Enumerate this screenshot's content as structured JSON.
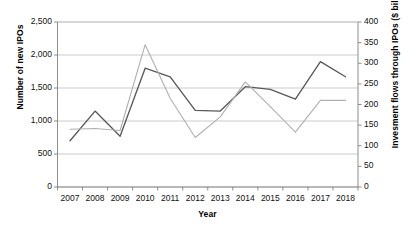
{
  "chart_data": {
    "type": "line",
    "title": "",
    "xlabel": "Year",
    "ylabel": "Number of new IPOs",
    "ylabel_secondary": "Invesment flows through IPOs ($ billion)",
    "categories": [
      "2007",
      "2008",
      "2009",
      "2010",
      "2011",
      "2012",
      "2013",
      "2014",
      "2015",
      "2016",
      "2017",
      "2018"
    ],
    "x": [
      2007,
      2008,
      2009,
      2010,
      2011,
      2012,
      2013,
      2014,
      2015,
      2016,
      2017,
      2018
    ],
    "ylim": [
      0,
      2500
    ],
    "yticks": [
      0,
      500,
      1000,
      1500,
      2000,
      2500
    ],
    "ytick_labels": [
      "0",
      "500",
      "1,000",
      "1,500",
      "2,000",
      "2,500"
    ],
    "ylim_secondary": [
      0,
      400
    ],
    "yticks_secondary": [
      0,
      50,
      100,
      150,
      200,
      250,
      300,
      350,
      400
    ],
    "ytick_labels_secondary": [
      "0",
      "50",
      "100",
      "150",
      "200",
      "250",
      "300",
      "350",
      "400"
    ],
    "grid": true,
    "legend": "none",
    "series": [
      {
        "name": "Number of new IPOs",
        "axis": "left",
        "color": "#595959",
        "values": [
          700,
          1150,
          770,
          1800,
          1670,
          1160,
          1150,
          1520,
          1480,
          1330,
          1900,
          1670
        ]
      },
      {
        "name": "Invesment flows through IPOs ($ billion)",
        "axis": "right",
        "color": "#b0b0b0",
        "values": [
          140,
          142,
          137,
          345,
          215,
          120,
          170,
          255,
          195,
          133,
          210,
          210
        ]
      }
    ]
  },
  "axis_ticks": {
    "left": [
      "2,500",
      "2,000",
      "1,500",
      "1,000",
      "500",
      "0"
    ],
    "right": [
      "400",
      "350",
      "300",
      "250",
      "200",
      "150",
      "100",
      "50",
      "0"
    ],
    "x": [
      "2007",
      "2008",
      "2009",
      "2010",
      "2011",
      "2012",
      "2013",
      "2014",
      "2015",
      "2016",
      "2017",
      "2018"
    ]
  },
  "labels": {
    "y_left_title": "Number of new IPOs",
    "y_right_title": "Invesment flows through IPOs ($ billion)",
    "x_title": "Year"
  },
  "colors": {
    "series_primary": "#595959",
    "series_secondary": "#b0b0b0",
    "grid": "#bfbfbf",
    "axis": "#808080",
    "text": "#111111"
  }
}
